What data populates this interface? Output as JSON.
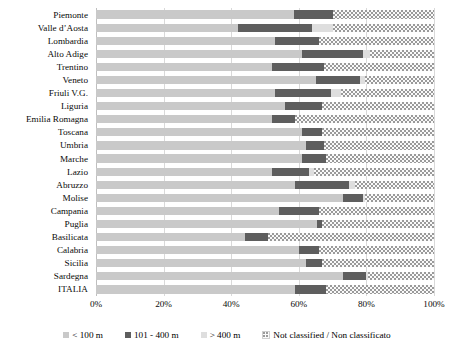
{
  "chart_data": {
    "type": "bar",
    "orientation": "horizontal",
    "stacked": true,
    "stack_normalized": true,
    "title": "",
    "subtitle": "",
    "xlabel": "",
    "ylabel": "",
    "xlim": [
      0,
      100
    ],
    "xticks": [
      "0%",
      "20%",
      "40%",
      "60%",
      "80%",
      "100%"
    ],
    "xtick_values": [
      0,
      20,
      40,
      60,
      80,
      100
    ],
    "grid": true,
    "legend_position": "bottom",
    "categories": [
      "Piemonte",
      "Valle d’Aosta",
      "Lombardia",
      "Alto Adige",
      "Trentino",
      "Veneto",
      "Friuli V.G.",
      "Liguria",
      "Emilia Romagna",
      "Toscana",
      "Umbria",
      "Marche",
      "Lazio",
      "Abruzzo",
      "Molise",
      "Campania",
      "Puglia",
      "Basilicata",
      "Calabria",
      "Sicilia",
      "Sardegna",
      "ITALIA"
    ],
    "series": [
      {
        "name": "< 100 m",
        "color": "#c9c9c9",
        "values": [
          58.7,
          42.0,
          53.0,
          61.0,
          52.0,
          65.0,
          53.0,
          56.0,
          52.0,
          61.0,
          62.0,
          61.0,
          52.0,
          59.0,
          73.0,
          54.0,
          65.5,
          44.0,
          60.0,
          62.0,
          73.0,
          59.0
        ]
      },
      {
        "name": "101 - 400 m",
        "color": "#5e5e5e",
        "values": [
          11.3,
          22.0,
          13.0,
          18.0,
          15.5,
          13.0,
          16.5,
          11.0,
          7.0,
          6.0,
          5.5,
          7.0,
          11.0,
          16.0,
          6.0,
          12.0,
          1.5,
          7.0,
          6.0,
          5.0,
          7.0,
          9.0
        ]
      },
      {
        "name": "> 400 m",
        "color": "#dedede",
        "values": [
          0.0,
          6.0,
          0.0,
          2.0,
          0.0,
          1.5,
          3.0,
          0.0,
          0.0,
          0.0,
          0.0,
          0.0,
          1.5,
          1.5,
          0.5,
          0.0,
          0.0,
          0.0,
          0.0,
          0.0,
          0.5,
          0.0
        ]
      },
      {
        "name": "Not classified / Non classificato",
        "color": "#fafafa",
        "pattern": "dotted",
        "values": [
          30.0,
          30.0,
          34.0,
          19.0,
          32.5,
          20.5,
          27.5,
          33.0,
          41.0,
          33.0,
          32.5,
          32.0,
          35.5,
          23.5,
          20.5,
          34.0,
          33.0,
          49.0,
          34.0,
          33.0,
          19.5,
          32.0
        ]
      }
    ],
    "legend": [
      {
        "label": "< 100 m",
        "swatch": "s0"
      },
      {
        "label": "101 - 400 m",
        "swatch": "s1"
      },
      {
        "label": "> 400 m",
        "swatch": "s2"
      },
      {
        "label": "Not classified / Non classificato",
        "swatch": "s3"
      }
    ],
    "colors": {
      "under_100m": "#c9c9c9",
      "between_101_400m": "#5e5e5e",
      "over_400m": "#dedede",
      "not_classified": "#fafafa",
      "gridline": "#d9d9d9",
      "text": "#0a0a0a"
    }
  }
}
